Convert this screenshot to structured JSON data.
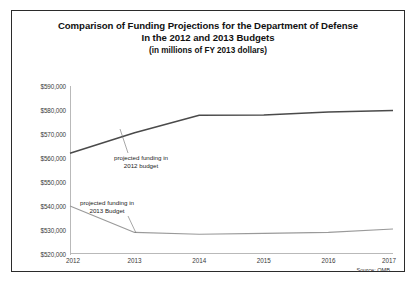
{
  "figure": {
    "title_line_1": "Comparison of Funding Projections for the Department of Defense",
    "title_line_2": "In the 2012 and 2013 Budgets",
    "title_line_3": "(in millions of FY 2013 dollars)",
    "source_note": "Source: OMB",
    "annotation_upper": "projected funding in\n2012 budget",
    "annotation_upper_line_1": "projected funding in",
    "annotation_upper_line_2": "2012 budget",
    "annotation_lower_line_1": "projected funding in",
    "annotation_lower_line_2": "2013 Budget",
    "line_color_upper": "#4a4a4a",
    "line_color_lower": "#9a9a9a",
    "axis_color": "#b9b9b9",
    "border_color": "#2b2b2b"
  },
  "chart_data": {
    "type": "line",
    "title": "Comparison of Funding Projections for the Department of Defense In the 2012 and 2013 Budgets (in millions of FY 2013 dollars)",
    "xlabel": "",
    "ylabel": "",
    "x": [
      2012,
      2013,
      2014,
      2015,
      2016,
      2017
    ],
    "categories": [
      "2012",
      "2013",
      "2014",
      "2015",
      "2016",
      "2017"
    ],
    "ylim": [
      520000,
      590000
    ],
    "ytick_values": [
      520000,
      530000,
      540000,
      550000,
      560000,
      570000,
      580000,
      590000
    ],
    "ytick_labels": [
      "$520,000",
      "$530,000",
      "$540,000",
      "$550,000",
      "$560,000",
      "$570,000",
      "$580,000",
      "$590,000"
    ],
    "grid": false,
    "legend": "annotations",
    "series": [
      {
        "name": "projected funding in 2012 budget",
        "color": "#4a4a4a",
        "values": [
          562000,
          570500,
          577800,
          577900,
          579200,
          579800
        ]
      },
      {
        "name": "projected funding in 2013 Budget",
        "color": "#9a9a9a",
        "values": [
          540000,
          529000,
          528200,
          528600,
          529000,
          530400
        ]
      }
    ],
    "annotations": [
      {
        "text": "projected funding in 2012 budget",
        "x": 2013,
        "y": 568000
      },
      {
        "text": "projected funding in 2013 Budget",
        "x": 2012.6,
        "y": 545000
      }
    ]
  }
}
